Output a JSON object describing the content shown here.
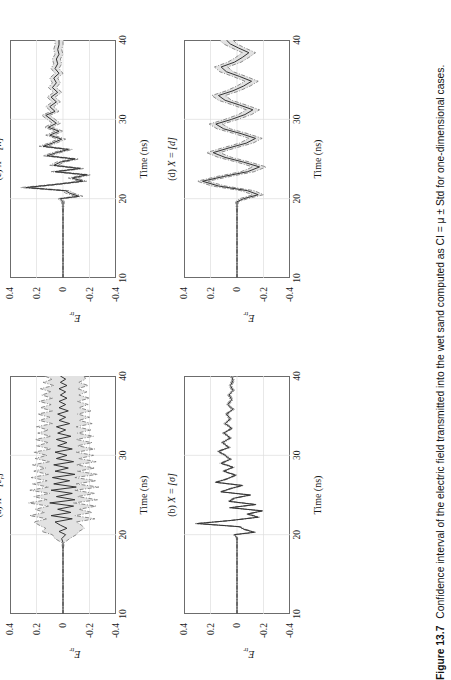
{
  "figure": {
    "number": "Figure 13.7",
    "caption": "Confidence interval of the electric field transmitted into the wet sand computed as CI = μ ± Std for one-dimensional cases.",
    "orientation": "rotated-90-ccw",
    "layout": "2x2 grid of time-series panels"
  },
  "axes": {
    "xlabel": "Time (ns)",
    "ylabel": "E",
    "ylabel_sub": "tr",
    "xticks": [
      10,
      20,
      30,
      40
    ],
    "yticks": [
      0.4,
      0.2,
      0,
      -0.2,
      -0.4
    ],
    "xtick_labels": [
      "10",
      "20",
      "30",
      "40"
    ],
    "ytick_labels": [
      "0.4",
      "0.2",
      "0",
      "-0.2",
      "-0.4"
    ],
    "xlim": [
      10,
      40
    ],
    "ylim": [
      -0.4,
      0.4
    ],
    "grid": true
  },
  "style": {
    "mean_color": "#333333",
    "bound_color": "#808080",
    "band_fill": "#e2e2e2",
    "frame_color": "#6c6c6c",
    "grid_color": "#dedede",
    "mean_linestyle": "solid",
    "bound_linestyle": "dash-dot"
  },
  "panels": [
    {
      "id": "a",
      "title_prefix": "(a)",
      "title_var": "X",
      "title_eq": "=",
      "title_val": "[ε",
      "title_sub": "r",
      "title_tail": "]",
      "title_full": "(a) X = [εr]",
      "band_width": "wide",
      "description": "Widest confidence band; dash-dot bounds diverge strongly from mean after t≈20 ns"
    },
    {
      "id": "b",
      "title_prefix": "(b)",
      "title_var": "X",
      "title_eq": "=",
      "title_val": "[σ]",
      "title_sub": "",
      "title_tail": "",
      "title_full": "(b) X = [σ]",
      "band_width": "very-narrow",
      "description": "Bounds almost coincide with mean; band barely visible"
    },
    {
      "id": "c",
      "title_prefix": "(c)",
      "title_var": "X",
      "title_eq": "=",
      "title_val": "[h]",
      "title_sub": "",
      "title_tail": "",
      "title_full": "(c) X = [h]",
      "band_width": "narrow",
      "description": "Thin but visible band hugging the mean trace"
    },
    {
      "id": "d",
      "title_prefix": "(d)",
      "title_var": "X",
      "title_eq": "=",
      "title_val": "[d]",
      "title_sub": "",
      "title_tail": "",
      "title_full": "(d) X = [d]",
      "band_width": "medium",
      "description": "Smooth low-frequency oscillation with moderate band"
    }
  ],
  "chart_data": {
    "type": "line",
    "xlabel": "Time (ns)",
    "ylabel": "E_tr",
    "xlim": [
      10,
      40
    ],
    "ylim": [
      -0.4,
      0.4
    ],
    "grid": true,
    "legend": null,
    "subplots": [
      {
        "panel": "a",
        "label": "(a) X = [εr]",
        "x": [
          10,
          11,
          12,
          13,
          14,
          15,
          16,
          17,
          18,
          19,
          19.5,
          20,
          20.4,
          20.8,
          21.2,
          21.6,
          22,
          22.4,
          22.8,
          23.2,
          23.6,
          24,
          24.4,
          24.8,
          25.2,
          25.6,
          26,
          26.4,
          26.8,
          27.2,
          27.6,
          28,
          28.4,
          28.8,
          29.2,
          29.6,
          30,
          30.4,
          30.8,
          31.2,
          31.6,
          32,
          32.4,
          32.8,
          33.2,
          33.6,
          34,
          34.4,
          34.8,
          35.2,
          35.6,
          36,
          36.4,
          36.8,
          37.2,
          37.6,
          38,
          38.4,
          38.8,
          39.2,
          39.6,
          40
        ],
        "series": [
          {
            "name": "mean",
            "values": [
              0,
              0,
              0,
              0,
              0,
              0,
              0,
              0,
              0,
              0,
              0.01,
              -0.02,
              0.03,
              -0.03,
              0.02,
              0.06,
              -0.07,
              0.09,
              -0.06,
              0.04,
              -0.08,
              0.1,
              -0.09,
              0.05,
              -0.07,
              0.09,
              -0.1,
              0.07,
              -0.05,
              0.08,
              -0.09,
              0.06,
              -0.04,
              0.07,
              -0.08,
              0.05,
              -0.03,
              0.06,
              -0.07,
              0.04,
              -0.03,
              0.05,
              -0.06,
              0.04,
              -0.02,
              0.05,
              -0.05,
              0.03,
              -0.02,
              0.04,
              -0.04,
              0.03,
              -0.02,
              0.03,
              -0.03,
              0.02,
              -0.02,
              0.03,
              -0.03,
              0.02,
              -0.02,
              0.02
            ]
          },
          {
            "name": "upper",
            "values": [
              0,
              0,
              0,
              0,
              0,
              0,
              0,
              0,
              0,
              0.01,
              0.06,
              0.08,
              0.16,
              0.13,
              0.18,
              0.22,
              0.12,
              0.25,
              0.14,
              0.21,
              0.11,
              0.26,
              0.12,
              0.22,
              0.1,
              0.25,
              0.11,
              0.23,
              0.12,
              0.24,
              0.11,
              0.22,
              0.13,
              0.23,
              0.1,
              0.21,
              0.12,
              0.22,
              0.09,
              0.2,
              0.11,
              0.21,
              0.09,
              0.19,
              0.11,
              0.2,
              0.08,
              0.18,
              0.1,
              0.19,
              0.08,
              0.17,
              0.09,
              0.18,
              0.08,
              0.16,
              0.09,
              0.17,
              0.07,
              0.15,
              0.08,
              0.14
            ]
          },
          {
            "name": "lower",
            "values": [
              0,
              0,
              0,
              0,
              0,
              0,
              0,
              0,
              0,
              -0.01,
              -0.05,
              -0.1,
              -0.12,
              -0.16,
              -0.14,
              -0.1,
              -0.24,
              -0.09,
              -0.22,
              -0.12,
              -0.25,
              -0.08,
              -0.26,
              -0.11,
              -0.24,
              -0.09,
              -0.27,
              -0.1,
              -0.25,
              -0.09,
              -0.26,
              -0.11,
              -0.24,
              -0.1,
              -0.25,
              -0.12,
              -0.23,
              -0.1,
              -0.24,
              -0.11,
              -0.22,
              -0.1,
              -0.23,
              -0.11,
              -0.21,
              -0.1,
              -0.22,
              -0.12,
              -0.2,
              -0.11,
              -0.21,
              -0.12,
              -0.19,
              -0.11,
              -0.2,
              -0.12,
              -0.18,
              -0.11,
              -0.19,
              -0.12,
              -0.17,
              -0.16
            ]
          }
        ]
      },
      {
        "panel": "b",
        "label": "(b) X = [σ]",
        "x": [
          10,
          12,
          14,
          16,
          18,
          19.6,
          20,
          20.3,
          20.7,
          21,
          21.4,
          21.8,
          22.2,
          22.6,
          23,
          23.4,
          23.8,
          24.2,
          24.6,
          25,
          25.4,
          25.8,
          26.2,
          26.6,
          27,
          27.5,
          28,
          28.5,
          29,
          29.5,
          30,
          30.5,
          31,
          31.6,
          32.2,
          32.8,
          33.4,
          34,
          34.6,
          35.2,
          35.8,
          36.4,
          37,
          37.6,
          38.2,
          38.8,
          39.4,
          40
        ],
        "series": [
          {
            "name": "mean",
            "values": [
              0,
              0,
              0,
              0,
              0,
              0,
              0.02,
              -0.13,
              -0.05,
              -0.02,
              0.3,
              0.04,
              -0.16,
              -0.08,
              -0.19,
              0.05,
              -0.14,
              0.06,
              0.02,
              -0.1,
              0.12,
              0.05,
              -0.04,
              0.16,
              0.08,
              0.01,
              0.1,
              0.03,
              0.12,
              0.05,
              0.09,
              0.14,
              0.06,
              0.11,
              0.05,
              0.1,
              0.04,
              0.09,
              0.05,
              0.08,
              0.03,
              0.07,
              0.04,
              0.06,
              0.03,
              0.05,
              0.03,
              0.04
            ]
          },
          {
            "name": "upper",
            "values": [
              0,
              0,
              0,
              0,
              0,
              0.005,
              0.03,
              -0.12,
              -0.04,
              -0.01,
              0.32,
              0.05,
              -0.15,
              -0.07,
              -0.18,
              0.06,
              -0.13,
              0.07,
              0.03,
              -0.09,
              0.13,
              0.06,
              -0.03,
              0.17,
              0.09,
              0.02,
              0.11,
              0.04,
              0.13,
              0.06,
              0.1,
              0.15,
              0.07,
              0.12,
              0.06,
              0.11,
              0.05,
              0.1,
              0.06,
              0.09,
              0.04,
              0.08,
              0.05,
              0.07,
              0.04,
              0.06,
              0.04,
              0.05
            ]
          },
          {
            "name": "lower",
            "values": [
              0,
              0,
              0,
              0,
              0,
              -0.005,
              0.01,
              -0.14,
              -0.06,
              -0.03,
              0.28,
              0.03,
              -0.17,
              -0.09,
              -0.2,
              0.04,
              -0.15,
              0.05,
              0.01,
              -0.11,
              0.11,
              0.04,
              -0.05,
              0.15,
              0.07,
              0.0,
              0.09,
              0.02,
              0.11,
              0.04,
              0.08,
              0.13,
              0.05,
              0.1,
              0.04,
              0.09,
              0.03,
              0.08,
              0.04,
              0.07,
              0.02,
              0.06,
              0.03,
              0.05,
              0.02,
              0.04,
              0.02,
              0.03
            ]
          }
        ]
      },
      {
        "panel": "c",
        "label": "(c) X = [h]",
        "x": [
          10,
          12,
          14,
          16,
          18,
          19.6,
          20,
          20.3,
          20.7,
          21,
          21.4,
          21.8,
          22.2,
          22.6,
          23,
          23.4,
          23.8,
          24.2,
          24.6,
          25,
          25.4,
          25.8,
          26.2,
          26.6,
          27,
          27.5,
          28,
          28.5,
          29,
          29.5,
          30,
          30.5,
          31,
          31.6,
          32.2,
          32.8,
          33.4,
          34,
          34.6,
          35.2,
          35.8,
          36.4,
          37,
          37.6,
          38.2,
          38.8,
          39.4,
          40
        ],
        "series": [
          {
            "name": "mean",
            "values": [
              0,
              0,
              0,
              0,
              0,
              0,
              0.02,
              -0.12,
              -0.05,
              -0.02,
              0.28,
              0.05,
              -0.15,
              -0.07,
              -0.18,
              0.06,
              -0.13,
              0.07,
              0.02,
              -0.09,
              0.12,
              0.05,
              -0.04,
              0.15,
              0.08,
              0.01,
              0.1,
              0.03,
              0.11,
              0.05,
              0.09,
              0.13,
              0.06,
              0.1,
              0.05,
              0.09,
              0.04,
              0.08,
              0.05,
              0.07,
              0.03,
              0.06,
              0.04,
              0.05,
              0.03,
              0.04,
              0.03,
              0.03
            ]
          },
          {
            "name": "upper",
            "values": [
              0,
              0,
              0,
              0,
              0,
              0.01,
              0.04,
              -0.09,
              -0.02,
              0.01,
              0.32,
              0.08,
              -0.12,
              -0.04,
              -0.15,
              0.09,
              -0.1,
              0.1,
              0.05,
              -0.06,
              0.15,
              0.08,
              -0.01,
              0.18,
              0.11,
              0.04,
              0.13,
              0.06,
              0.14,
              0.08,
              0.12,
              0.16,
              0.09,
              0.13,
              0.08,
              0.12,
              0.07,
              0.11,
              0.08,
              0.1,
              0.06,
              0.09,
              0.07,
              0.08,
              0.06,
              0.07,
              0.06,
              0.06
            ]
          },
          {
            "name": "lower",
            "values": [
              0,
              0,
              0,
              0,
              0,
              -0.01,
              0.0,
              -0.15,
              -0.08,
              -0.05,
              0.24,
              0.02,
              -0.18,
              -0.1,
              -0.21,
              0.03,
              -0.16,
              0.04,
              -0.01,
              -0.12,
              0.09,
              0.02,
              -0.07,
              0.12,
              0.05,
              -0.02,
              0.07,
              0.0,
              0.08,
              0.02,
              0.06,
              0.1,
              0.03,
              0.07,
              0.02,
              0.06,
              0.01,
              0.05,
              0.02,
              0.04,
              0.0,
              0.03,
              0.01,
              0.02,
              0.0,
              0.01,
              0.0,
              0.0
            ]
          }
        ]
      },
      {
        "panel": "d",
        "label": "(d) X = [d]",
        "x": [
          10,
          12,
          14,
          16,
          18,
          19.6,
          20,
          20.5,
          21,
          21.6,
          22.2,
          22.8,
          23.4,
          24,
          24.6,
          25.2,
          25.8,
          26.4,
          27,
          27.6,
          28.2,
          28.8,
          29.4,
          30,
          30.6,
          31.2,
          31.8,
          32.4,
          33,
          33.6,
          34.2,
          34.8,
          35.4,
          36,
          36.6,
          37.2,
          37.8,
          38.4,
          39,
          39.5,
          40
        ],
        "series": [
          {
            "name": "mean",
            "values": [
              0,
              0,
              0,
              0,
              0,
              0,
              -0.05,
              -0.16,
              -0.08,
              0.14,
              0.26,
              0.1,
              -0.08,
              -0.17,
              -0.05,
              0.09,
              0.18,
              0.06,
              -0.07,
              -0.14,
              -0.03,
              0.1,
              0.16,
              0.04,
              -0.06,
              -0.12,
              -0.02,
              0.09,
              0.14,
              0.03,
              -0.05,
              -0.11,
              -0.02,
              0.08,
              0.12,
              0.02,
              -0.04,
              -0.09,
              -0.01,
              0.05,
              0.08
            ]
          },
          {
            "name": "upper",
            "values": [
              0,
              0,
              0,
              0,
              0,
              0.01,
              -0.02,
              -0.12,
              -0.03,
              0.19,
              0.3,
              0.15,
              -0.03,
              -0.12,
              0.0,
              0.14,
              0.23,
              0.11,
              -0.02,
              -0.09,
              0.02,
              0.15,
              0.21,
              0.09,
              -0.01,
              -0.07,
              0.03,
              0.14,
              0.19,
              0.08,
              0.0,
              -0.06,
              0.03,
              0.13,
              0.17,
              0.07,
              0.01,
              -0.04,
              0.04,
              0.1,
              0.13
            ]
          },
          {
            "name": "lower",
            "values": [
              0,
              0,
              0,
              0,
              0,
              -0.01,
              -0.08,
              -0.2,
              -0.13,
              0.09,
              0.22,
              0.05,
              -0.13,
              -0.22,
              -0.1,
              0.04,
              0.13,
              0.01,
              -0.12,
              -0.19,
              -0.08,
              0.05,
              0.11,
              -0.01,
              -0.11,
              -0.17,
              -0.07,
              0.04,
              0.09,
              -0.02,
              -0.1,
              -0.16,
              -0.07,
              0.03,
              0.07,
              -0.03,
              -0.09,
              -0.14,
              -0.06,
              0.0,
              0.03
            ]
          }
        ]
      }
    ]
  }
}
